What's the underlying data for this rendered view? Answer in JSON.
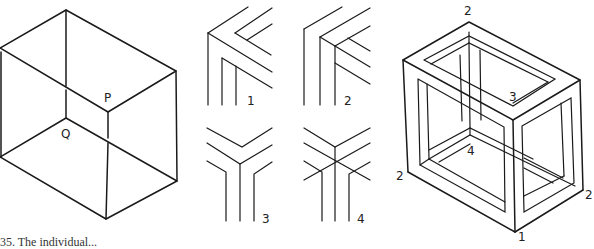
{
  "figure": {
    "left_box": {
      "labels": {
        "p": "P",
        "q": "Q"
      }
    },
    "corner_details": {
      "labels": [
        "1",
        "2",
        "3",
        "4"
      ]
    },
    "frame_cube": {
      "labels": {
        "top": "2",
        "left": "2",
        "right": "2",
        "inner_top": "3",
        "inner_bottom": "4",
        "bottom": "1"
      }
    },
    "caption": "35. The individual..."
  },
  "colors": {
    "ink": "#1a1a1a",
    "background": "#ffffff"
  }
}
